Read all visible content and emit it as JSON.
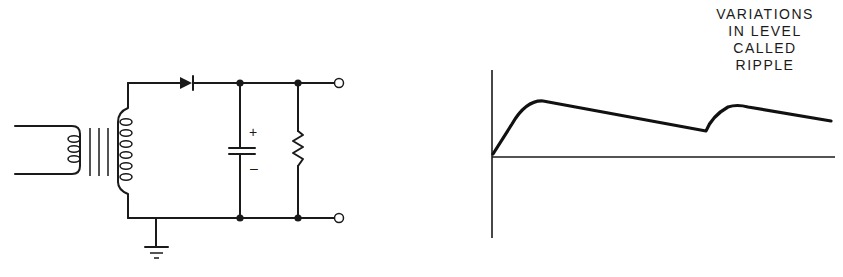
{
  "figure": {
    "circuit": {
      "title": "Half-wave rectifier with capacitor filter",
      "components": [
        {
          "id": "transformer",
          "type": "transformer",
          "primary_turns_drawn": 3,
          "secondary_turns_drawn": 6,
          "core_lines": 3
        },
        {
          "id": "diode",
          "type": "diode"
        },
        {
          "id": "capacitor",
          "type": "electrolytic-capacitor",
          "positive_label": "+",
          "negative_label": "–"
        },
        {
          "id": "resistor",
          "type": "resistor"
        },
        {
          "id": "ground",
          "type": "ground"
        },
        {
          "id": "output_terminals",
          "type": "terminal",
          "count": 2
        }
      ]
    },
    "waveform": {
      "annotation": [
        "VARIATIONS",
        "IN LEVEL",
        "CALLED",
        "RIPPLE"
      ]
    }
  },
  "colors": {
    "ink": "#1a1a1a",
    "background": "#ffffff"
  }
}
